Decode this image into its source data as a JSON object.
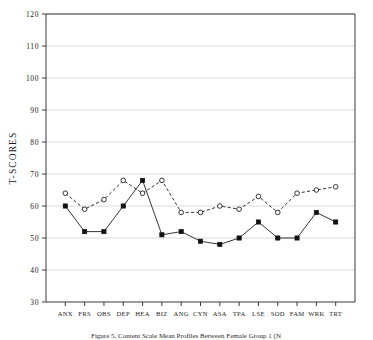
{
  "figure": {
    "ylabel": "T-SCORES",
    "caption": "Figure 5. Content Scale Mean Profiles Between Female Group 1 (N",
    "title": ""
  },
  "chart_data": {
    "type": "line",
    "title": "",
    "xlabel": "",
    "ylabel": "T-SCORES",
    "ylim": [
      30,
      120
    ],
    "xlim": [
      0,
      16
    ],
    "ytick_step": 10,
    "yticks": [
      30,
      40,
      50,
      60,
      70,
      80,
      90,
      100,
      110,
      120
    ],
    "grid": true,
    "legend": "none",
    "categories": [
      "ANX",
      "FRS",
      "OBS",
      "DEP",
      "HEA",
      "BIZ",
      "ANG",
      "CYN",
      "ASA",
      "TPA",
      "LSE",
      "SOD",
      "FAM",
      "WRK",
      "TRT"
    ],
    "series": [
      {
        "name": "Group 1",
        "marker": "filled-square",
        "linestyle": "solid",
        "values": [
          60,
          52,
          52,
          60,
          68,
          51,
          52,
          49,
          48,
          50,
          55,
          50,
          50,
          58,
          55
        ]
      },
      {
        "name": "Group 2",
        "marker": "open-circle",
        "linestyle": "dashed",
        "values": [
          64,
          59,
          62,
          68,
          64,
          68,
          58,
          58,
          60,
          59,
          63,
          58,
          64,
          65,
          66
        ]
      }
    ]
  }
}
